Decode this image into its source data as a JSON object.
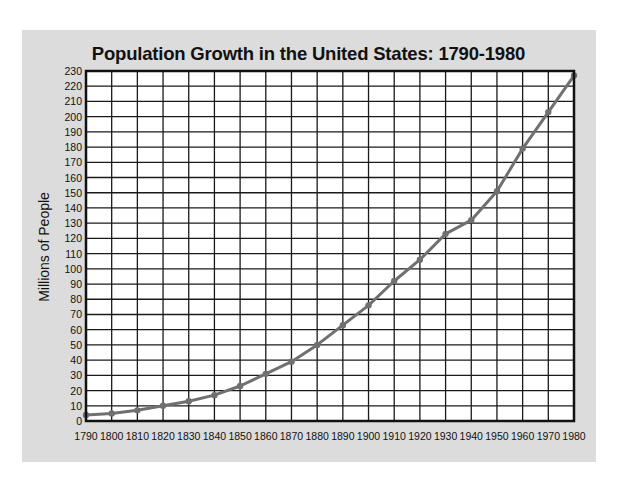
{
  "chart_data": {
    "type": "line",
    "title": "Population Growth in the United States: 1790-1980",
    "xlabel": "",
    "ylabel": "Millions of People",
    "x": [
      1790,
      1800,
      1810,
      1820,
      1830,
      1840,
      1850,
      1860,
      1870,
      1880,
      1890,
      1900,
      1910,
      1920,
      1930,
      1940,
      1950,
      1960,
      1970,
      1980
    ],
    "series": [
      {
        "name": "US Population (millions)",
        "values": [
          4,
          5,
          7,
          10,
          13,
          17,
          23,
          31,
          39,
          50,
          63,
          76,
          92,
          106,
          123,
          132,
          151,
          179,
          203,
          227
        ]
      }
    ],
    "xlim": [
      1790,
      1980
    ],
    "ylim": [
      0,
      230
    ],
    "x_ticks": [
      "1790",
      "1800",
      "1810",
      "1820",
      "1830",
      "1840",
      "1850",
      "1860",
      "1870",
      "1880",
      "1890",
      "1900",
      "1910",
      "1920",
      "1930",
      "1940",
      "1950",
      "1960",
      "1970",
      "1980"
    ],
    "y_ticks": [
      "0",
      "10",
      "20",
      "30",
      "40",
      "50",
      "60",
      "70",
      "80",
      "90",
      "100",
      "110",
      "120",
      "130",
      "140",
      "150",
      "160",
      "170",
      "180",
      "190",
      "200",
      "210",
      "220",
      "230"
    ],
    "grid": true,
    "legend": "none",
    "colors": {
      "line": "#707070",
      "marker": "#707070",
      "grid": "#1a1a1a",
      "panel_background": "#dcdcdc",
      "plot_background": "#ffffff"
    }
  }
}
